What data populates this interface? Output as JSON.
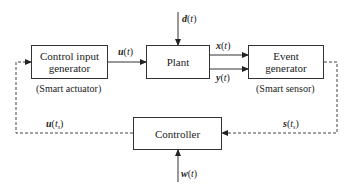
{
  "diagram": {
    "blocks": {
      "control_input_generator": {
        "label": "Control input generator",
        "line1": "Control input",
        "line2": "generator",
        "caption": "(Smart actuator)"
      },
      "plant": {
        "label": "Plant"
      },
      "event_generator": {
        "label": "Event generator",
        "line1": "Event",
        "line2": "generator",
        "caption": "(Smart sensor)"
      },
      "controller": {
        "label": "Controller"
      }
    },
    "signals": {
      "disturbance": {
        "sym": "d",
        "arg": "t",
        "text": "d(t)"
      },
      "control_input": {
        "sym": "u",
        "arg": "t",
        "text": "u(t)"
      },
      "state": {
        "sym": "x",
        "arg": "t",
        "text": "x(t)"
      },
      "output": {
        "sym": "y",
        "arg": "t",
        "text": "y(t)"
      },
      "sampled_control": {
        "sym": "u",
        "arg": "t",
        "sub": "s",
        "text": "u(t_s)"
      },
      "sampled_signal": {
        "sym": "s",
        "arg": "t",
        "sub": "s",
        "text": "s(t_s)"
      },
      "reference": {
        "sym": "w",
        "arg": "t",
        "text": "w(t)"
      }
    },
    "colors": {
      "line": "#333333",
      "background": "#ffffff"
    }
  }
}
